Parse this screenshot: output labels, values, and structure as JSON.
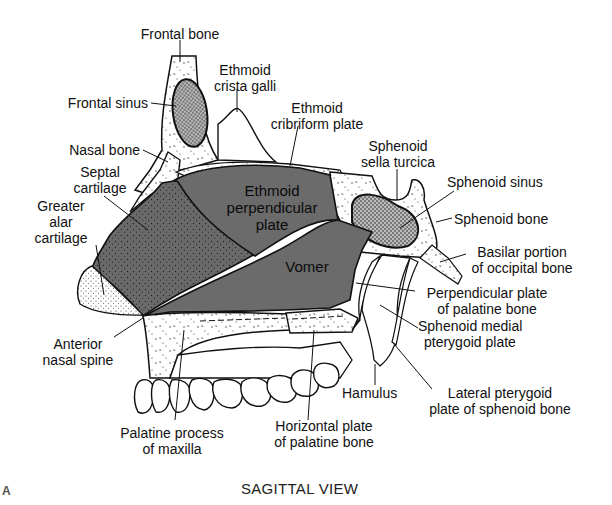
{
  "figure": {
    "panel_letter": "A",
    "caption": "SAGITTAL VIEW",
    "colors": {
      "background": "#ffffff",
      "bone_fill": "#ffffff",
      "ethmoid_vomer_fill": "#6b6b6b",
      "septal_cartilage_fill": "#5a5a5a",
      "outline": "#111111"
    }
  },
  "inner_labels": {
    "ethmoid_perpendicular_plate": [
      "Ethmoid",
      "perpendicular",
      "plate"
    ],
    "vomer": "Vomer"
  },
  "labels": {
    "frontal_bone": [
      "Frontal bone"
    ],
    "ethmoid_crista_galli": [
      "Ethmoid",
      "crista galli"
    ],
    "frontal_sinus": [
      "Frontal sinus"
    ],
    "ethmoid_cribriform_plate": [
      "Ethmoid",
      "cribriform plate"
    ],
    "nasal_bone": [
      "Nasal bone"
    ],
    "sphenoid_sella_turcica": [
      "Sphenoid",
      "sella turcica"
    ],
    "septal_cartilage": [
      "Septal",
      "cartilage"
    ],
    "sphenoid_sinus": [
      "Sphenoid sinus"
    ],
    "greater_alar_cartilage": [
      "Greater",
      "alar",
      "cartilage"
    ],
    "sphenoid_bone": [
      "Sphenoid bone"
    ],
    "basilar_portion": [
      "Basilar portion",
      "of occipital bone"
    ],
    "perpendicular_plate_palatine": [
      "Perpendicular plate",
      "of palatine bone"
    ],
    "sphenoid_medial_pterygoid": [
      "Sphenoid medial",
      "pterygoid plate"
    ],
    "anterior_nasal_spine": [
      "Anterior",
      "nasal spine"
    ],
    "hamulus": [
      "Hamulus"
    ],
    "lateral_pterygoid": [
      "Lateral pterygoid",
      "plate of sphenoid bone"
    ],
    "palatine_process": [
      "Palatine process",
      "of maxilla"
    ],
    "horizontal_plate": [
      "Horizontal plate",
      "of palatine bone"
    ]
  }
}
